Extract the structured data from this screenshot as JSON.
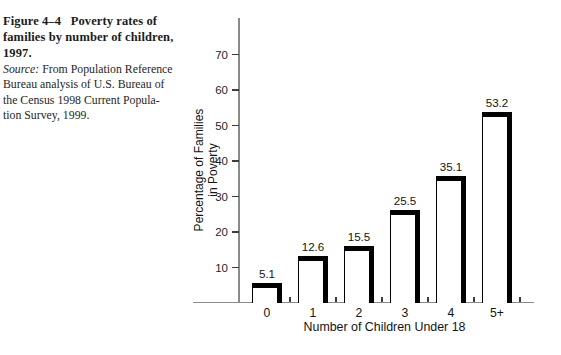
{
  "caption": {
    "title_lines": [
      "Figure 4–4   Poverty rates of",
      "families by number of children,",
      "1997."
    ],
    "source_label": "Source:",
    "source_after_label": " From Population Reference",
    "source_lines": [
      "Bureau analysis of U.S. Bureau of",
      "the Census 1998 Current Popula-",
      "tion Survey, 1999."
    ]
  },
  "chart_data": {
    "type": "bar",
    "categories": [
      "0",
      "1",
      "2",
      "3",
      "4",
      "5+"
    ],
    "values": [
      5.1,
      12.6,
      15.5,
      25.5,
      35.1,
      53.2
    ],
    "data_labels": [
      "5.1",
      "12.6",
      "15.5",
      "25.5",
      "35.1",
      "53.2"
    ],
    "title": "",
    "xlabel": "Number of Children Under 18",
    "ylabel_lines": [
      "Percentage of Families",
      "in Poverty"
    ],
    "y_ticks": [
      10,
      20,
      30,
      40,
      50,
      60,
      70
    ],
    "ylim": [
      0,
      78
    ],
    "grid": false,
    "legend_position": "none",
    "bar_fill": "#ffffff",
    "bar_edge": "#000000",
    "axis_color": "#8a8a8a"
  }
}
